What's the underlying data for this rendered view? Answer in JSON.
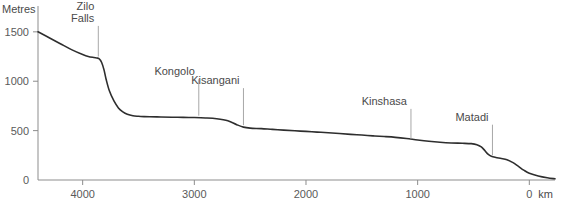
{
  "chart_data": {
    "type": "line",
    "title": "",
    "subtitle": "",
    "xlabel": "km",
    "ylabel": "Metres",
    "xlim": [
      4400,
      -230
    ],
    "ylim": [
      0,
      1640
    ],
    "x_reversed": true,
    "grid": false,
    "legend": "none",
    "x_ticks": [
      4000,
      3000,
      2000,
      1000,
      0
    ],
    "x_tick_labels": [
      "4000",
      "3000",
      "2000",
      "1000",
      "0"
    ],
    "y_ticks": [
      0,
      500,
      1000,
      1500
    ],
    "y_tick_labels": [
      "0",
      "500",
      "1000",
      "1500"
    ],
    "series_name": "Congo River long profile",
    "x": [
      4400,
      4300,
      4200,
      4100,
      4000,
      3950,
      3900,
      3870,
      3850,
      3830,
      3810,
      3790,
      3760,
      3720,
      3680,
      3640,
      3600,
      3550,
      3500,
      3450,
      3400,
      3300,
      3200,
      3100,
      3000,
      2900,
      2800,
      2700,
      2620,
      2560,
      2500,
      2400,
      2300,
      2200,
      2100,
      2000,
      1900,
      1800,
      1700,
      1600,
      1500,
      1400,
      1300,
      1200,
      1100,
      1000,
      900,
      800,
      700,
      600,
      520,
      470,
      430,
      400,
      370,
      340,
      300,
      250,
      200,
      150,
      100,
      50,
      0,
      -80,
      -160,
      -230
    ],
    "y": [
      1500,
      1440,
      1380,
      1320,
      1270,
      1250,
      1240,
      1235,
      1225,
      1190,
      1120,
      1020,
      900,
      800,
      730,
      690,
      665,
      650,
      645,
      642,
      640,
      638,
      636,
      634,
      632,
      628,
      620,
      600,
      560,
      535,
      525,
      520,
      512,
      505,
      498,
      492,
      485,
      478,
      470,
      462,
      455,
      447,
      440,
      432,
      420,
      405,
      392,
      382,
      375,
      372,
      368,
      358,
      335,
      300,
      262,
      240,
      228,
      218,
      205,
      178,
      140,
      100,
      68,
      40,
      22,
      12
    ],
    "annotations": [
      {
        "label": "Zilo Falls",
        "label_lines": [
          "Zilo",
          "Falls"
        ],
        "x": 3860,
        "y": 1230,
        "leader_top_y": 1560
      },
      {
        "label": "Kongolo",
        "label_lines": [
          "Kongolo"
        ],
        "x": 2960,
        "y": 631,
        "leader_top_y": 1020
      },
      {
        "label": "Kisangani",
        "label_lines": [
          "Kisangani"
        ],
        "x": 2560,
        "y": 535,
        "leader_top_y": 930
      },
      {
        "label": "Kinshasa",
        "label_lines": [
          "Kinshasa"
        ],
        "x": 1060,
        "y": 398,
        "leader_top_y": 720
      },
      {
        "label": "Matadi",
        "label_lines": [
          "Matadi"
        ],
        "x": 330,
        "y": 232,
        "leader_top_y": 560
      }
    ]
  },
  "axes": {
    "y_axis_title": "Metres",
    "x_axis_title": "km"
  },
  "colors": {
    "profile_line": "#2e2e2e",
    "axis": "#8d8d8d",
    "leader": "#a8a8a8",
    "text": "#4a4a4a",
    "background": "#ffffff"
  }
}
